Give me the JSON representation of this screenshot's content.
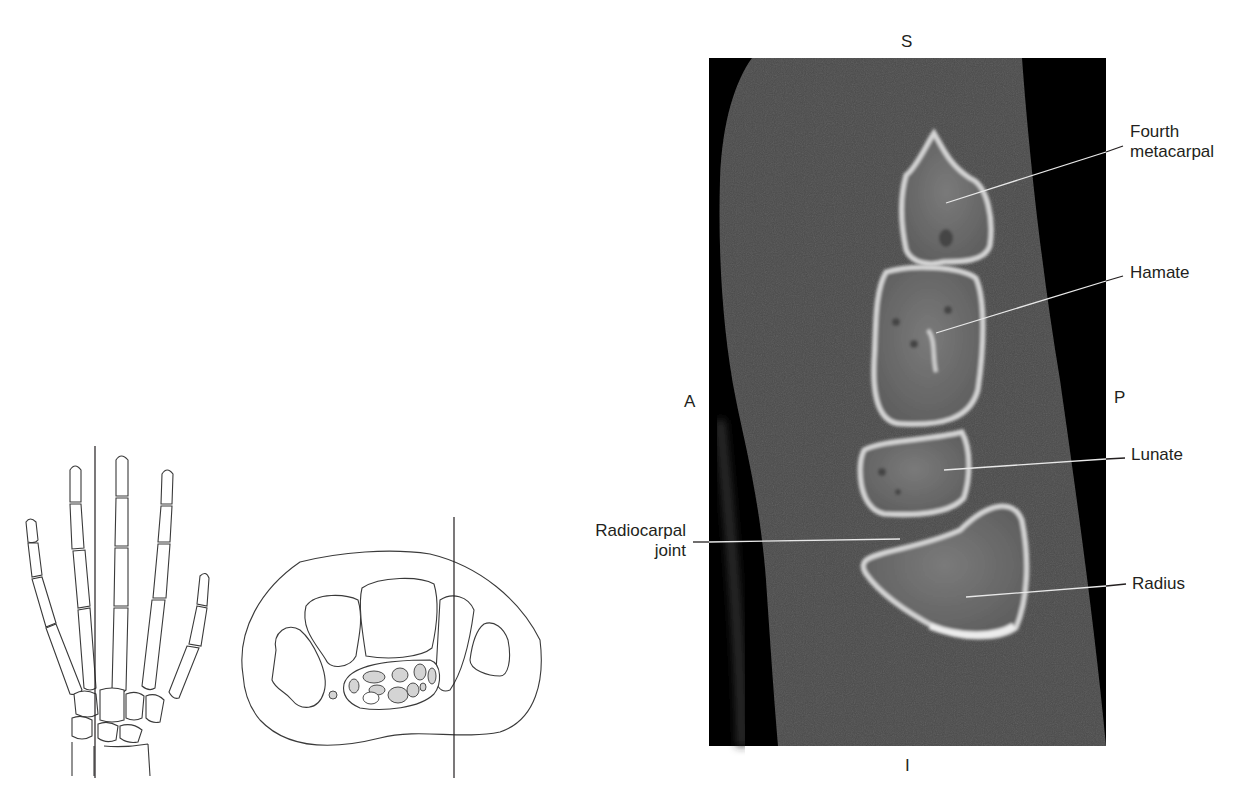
{
  "figure": {
    "type": "Sagittal CT of the wrist with locator diagrams",
    "orientation_labels": {
      "superior": "S",
      "inferior": "I",
      "anterior": "A",
      "posterior": "P"
    },
    "annotations": [
      {
        "id": "fourth-metacarpal",
        "line1": "Fourth",
        "line2": "metacarpal"
      },
      {
        "id": "hamate",
        "line1": "Hamate"
      },
      {
        "id": "lunate",
        "line1": "Lunate"
      },
      {
        "id": "radius",
        "line1": "Radius"
      },
      {
        "id": "radiocarpal-joint",
        "line1": "Radiocarpal",
        "line2": "joint"
      }
    ],
    "colors": {
      "ct_background": "#000000",
      "soft_tissue": "#4a4a4a",
      "bone_cortex": "#d8d8d8",
      "bone_marrow": "#6e6e6e",
      "leader_line_on_image": "#e8e8e8",
      "leader_line_on_paper": "#231f20",
      "diagram_stroke": "#3a3a3a",
      "tendon_fill": "#d4d4d4"
    }
  }
}
